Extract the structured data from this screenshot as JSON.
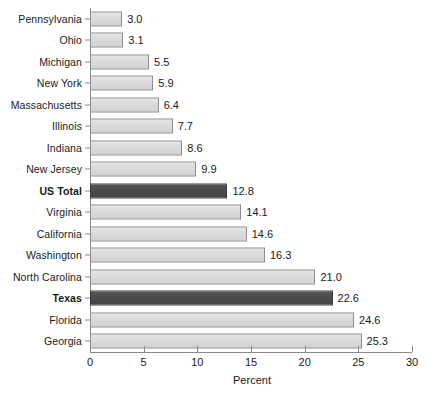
{
  "chart_data": {
    "type": "bar",
    "orientation": "horizontal",
    "title": "",
    "subtitle": "",
    "xlabel": "Percent",
    "ylabel": "",
    "xlim": [
      0,
      30
    ],
    "xticks": [
      0,
      5,
      10,
      15,
      20,
      25,
      30
    ],
    "grid": false,
    "legend": null,
    "categories": [
      "Pennsylvania",
      "Ohio",
      "Michigan",
      "New York",
      "Massachusetts",
      "Illinois",
      "Indiana",
      "New Jersey",
      "US Total",
      "Virginia",
      "California",
      "Washington",
      "North Carolina",
      "Texas",
      "Florida",
      "Georgia"
    ],
    "values": [
      3.0,
      3.1,
      5.5,
      5.9,
      6.4,
      7.7,
      8.6,
      9.9,
      12.8,
      14.1,
      14.6,
      16.3,
      21.0,
      22.6,
      24.6,
      25.3
    ],
    "value_labels": [
      "3.0",
      "3.1",
      "5.5",
      "5.9",
      "6.4",
      "7.7",
      "8.6",
      "9.9",
      "12.8",
      "14.1",
      "14.6",
      "16.3",
      "21.0",
      "22.6",
      "24.6",
      "25.3"
    ],
    "highlighted": [
      "US Total",
      "Texas"
    ],
    "bold_labels": [
      "US Total",
      "Texas"
    ],
    "colors": {
      "bar_light": "#d8d8d8",
      "bar_light_border": "#8d8d8d",
      "bar_dark": "#4a4a4a",
      "bar_dark_border": "#3c3c3c",
      "axis": "#8a8a8a",
      "text": "#1a1a1a",
      "background": "#ffffff"
    }
  }
}
